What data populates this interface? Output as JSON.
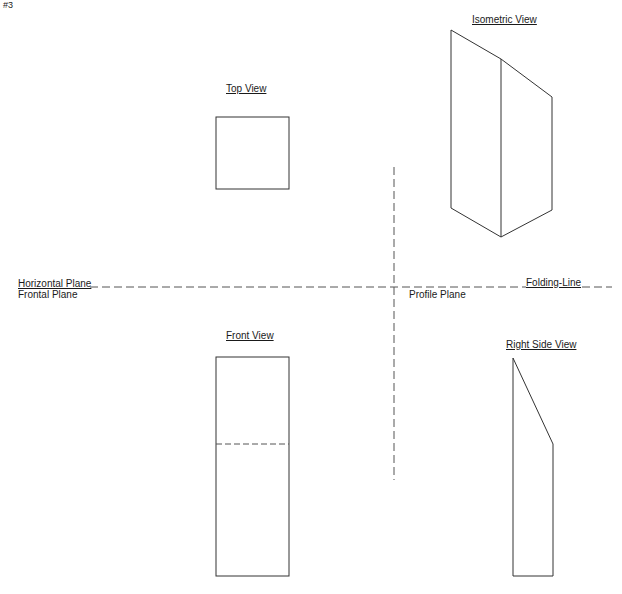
{
  "page_marker": "#3",
  "views": {
    "top": {
      "title": "Top View"
    },
    "isometric": {
      "title": "Isometric View"
    },
    "front": {
      "title": "Front View"
    },
    "right_side": {
      "title": "Right Side View"
    }
  },
  "planes": {
    "horizontal": "Horizontal Plane",
    "frontal": "Frontal Plane",
    "profile": "Profile Plane",
    "folding_line": "Folding-Line"
  },
  "colors": {
    "line": "#333333",
    "dashed": "#555555",
    "background": "#ffffff"
  }
}
